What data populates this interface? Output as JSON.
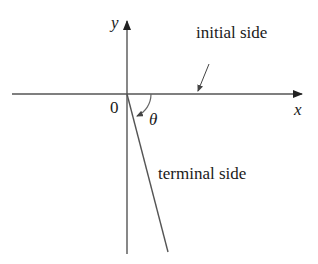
{
  "diagram": {
    "type": "angle-in-standard-position",
    "axes": {
      "x_label": "x",
      "y_label": "y",
      "origin_label": "0"
    },
    "angle_label": "θ",
    "annotations": {
      "initial_side": "initial side",
      "terminal_side": "terminal side"
    },
    "colors": {
      "line": "#555555",
      "text": "#1a1a1a",
      "background": "#ffffff"
    }
  }
}
